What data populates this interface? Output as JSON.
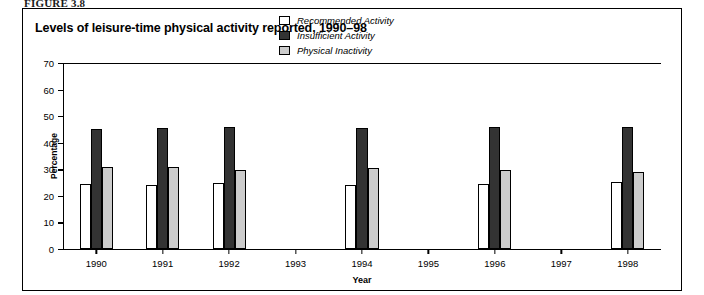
{
  "figure_label": "FIGURE 3.8",
  "chart_title": "Levels of leisure-time physical activity reported, 1990–98",
  "legend": [
    {
      "key": "recommended",
      "label": "Recommended Activity",
      "color": "#ffffff"
    },
    {
      "key": "insufficient",
      "label": "Insufficient Activity",
      "color": "#333333"
    },
    {
      "key": "inactivity",
      "label": "Physical Inactivity",
      "color": "#cccccc"
    }
  ],
  "chart_data": {
    "type": "bar",
    "title": "Levels of leisure-time physical activity reported, 1990–98",
    "xlabel": "Year",
    "ylabel": "Percentage",
    "ylim": [
      0,
      70
    ],
    "yticks": [
      0,
      10,
      20,
      30,
      40,
      50,
      60,
      70
    ],
    "grid": false,
    "legend_position": "top-center",
    "categories": [
      "1990",
      "1991",
      "1992",
      "1993",
      "1994",
      "1995",
      "1996",
      "1997",
      "1998"
    ],
    "series": [
      {
        "name": "Recommended Activity",
        "color": "#ffffff",
        "values": [
          24.3,
          24.1,
          24.8,
          null,
          24.2,
          null,
          24.4,
          null,
          25.4
        ]
      },
      {
        "name": "Insufficient Activity",
        "color": "#333333",
        "values": [
          45.3,
          45.5,
          45.8,
          null,
          45.6,
          null,
          46.1,
          null,
          45.9
        ]
      },
      {
        "name": "Physical Inactivity",
        "color": "#cccccc",
        "values": [
          30.9,
          30.8,
          29.7,
          null,
          30.4,
          null,
          29.9,
          null,
          28.9
        ]
      }
    ]
  }
}
